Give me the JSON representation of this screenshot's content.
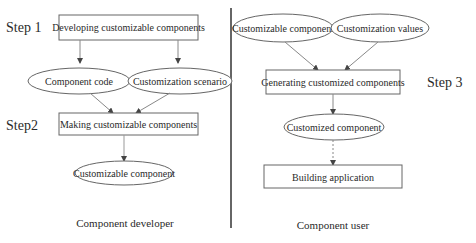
{
  "steps": {
    "step1": "Step 1",
    "step2": "Step2",
    "step3": "Step 3"
  },
  "developer": {
    "box1": "Developing customizable components",
    "ellipse_code": "Component code",
    "ellipse_scenario": "Customization scenario",
    "box2": "Making customizable components",
    "ellipse_output": "Customizable component",
    "caption": "Component developer"
  },
  "user": {
    "ellipse_component": "Customizable component",
    "ellipse_values": "Customization values",
    "box_generate": "Generating customized components",
    "ellipse_customized": "Customized component",
    "box_build": "Building application",
    "caption": "Component user"
  }
}
